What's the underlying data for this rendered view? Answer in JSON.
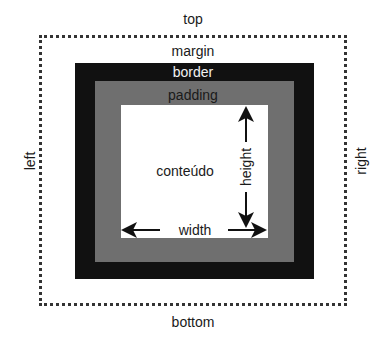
{
  "diagram": {
    "type": "css-box-model",
    "labels": {
      "top": "top",
      "bottom": "bottom",
      "left": "left",
      "right": "right",
      "margin": "margin",
      "border": "border",
      "padding": "padding",
      "content": "conteúdo",
      "width": "width",
      "height": "height"
    },
    "colors": {
      "border": "#111111",
      "padding": "#6f6f6f",
      "content": "#ffffff",
      "margin_outline": "#333333"
    }
  }
}
